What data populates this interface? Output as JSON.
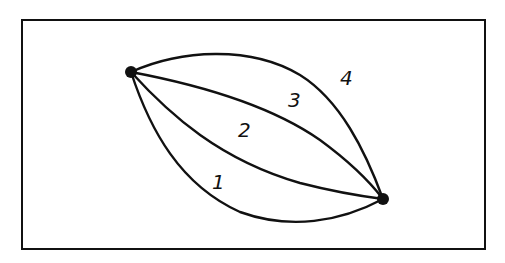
{
  "diagram": {
    "frame": {
      "x": 22,
      "y": 20,
      "width": 463,
      "height": 229,
      "stroke": "#111111"
    },
    "colors": {
      "ink": "#111111",
      "background": "#ffffff"
    },
    "vertices": [
      {
        "id": "A",
        "x": 131,
        "y": 72
      },
      {
        "id": "B",
        "x": 383,
        "y": 199
      }
    ],
    "edges": [
      {
        "label": "1",
        "path": "M131,72 C150,130 180,185 240,212 C290,230 340,222 383,199",
        "label_pos": {
          "x": 212,
          "y": 172
        }
      },
      {
        "label": "2",
        "path": "M131,72 C170,115 220,160 300,183 C335,192 360,196 383,199",
        "label_pos": {
          "x": 238,
          "y": 120
        }
      },
      {
        "label": "3",
        "path": "M131,72 C200,85 270,105 320,140 C350,162 370,182 383,199",
        "label_pos": {
          "x": 288,
          "y": 90
        }
      },
      {
        "label": "4",
        "path": "M131,72 C180,50 250,45 300,75 C340,100 365,150 383,199",
        "label_pos": {
          "x": 340,
          "y": 68
        }
      }
    ]
  }
}
